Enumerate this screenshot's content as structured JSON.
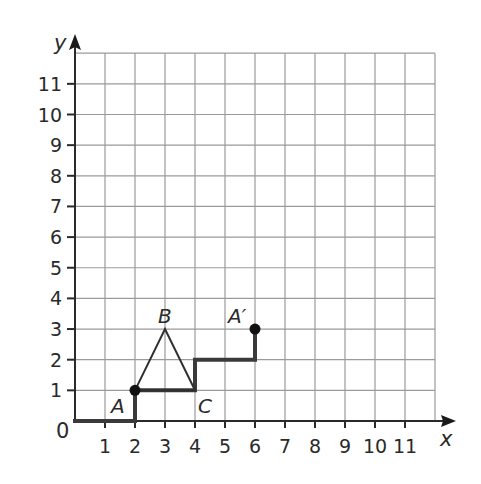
{
  "figure": {
    "x_axis_label": "x",
    "y_axis_label": "y",
    "origin_label": "0",
    "x_ticks": [
      "1",
      "2",
      "3",
      "4",
      "5",
      "6",
      "7",
      "8",
      "9",
      "10",
      "11"
    ],
    "y_ticks": [
      "1",
      "2",
      "3",
      "4",
      "5",
      "6",
      "7",
      "8",
      "9",
      "10",
      "11"
    ],
    "grid": {
      "x_min": 0,
      "x_max": 12,
      "y_min": 0,
      "y_max": 12
    },
    "triangle": {
      "vertices": [
        {
          "label": "A",
          "x": 2,
          "y": 1
        },
        {
          "label": "B",
          "x": 3,
          "y": 3
        },
        {
          "label": "C",
          "x": 4,
          "y": 1
        }
      ]
    },
    "image_point": {
      "label": "A′",
      "x": 6,
      "y": 3
    },
    "staircase_path": [
      [
        0,
        0
      ],
      [
        2,
        0
      ],
      [
        2,
        1
      ],
      [
        4,
        1
      ],
      [
        4,
        2
      ],
      [
        6,
        2
      ],
      [
        6,
        3
      ]
    ],
    "dots": [
      {
        "name": "A",
        "x": 2,
        "y": 1
      },
      {
        "name": "A′",
        "x": 6,
        "y": 3
      }
    ]
  }
}
